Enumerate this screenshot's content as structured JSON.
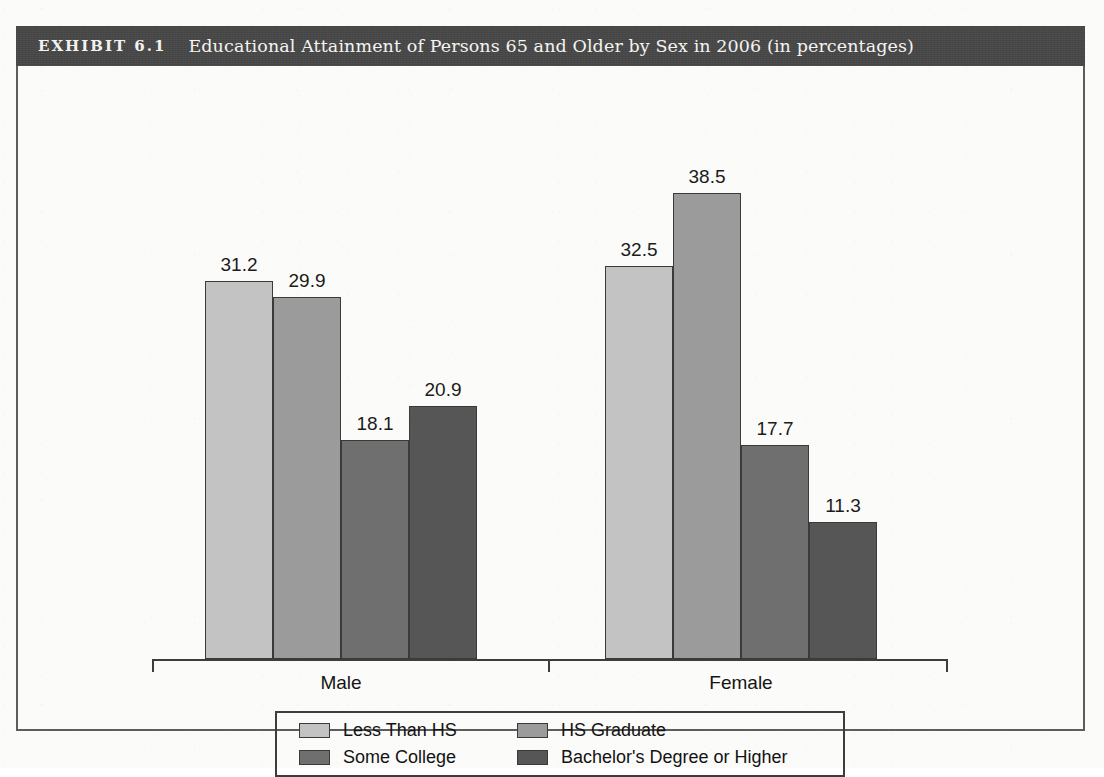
{
  "exhibit": {
    "label": "EXHIBIT 6.1",
    "title": "Educational Attainment of Persons 65 and Older by Sex in 2006 (in percentages)",
    "banner_color": "#474747",
    "banner_text_color": "#f2f2ee",
    "frame_color": "#5d5d5d",
    "page_background": "#fbfbf9"
  },
  "chart_data": {
    "type": "bar",
    "title": "Educational Attainment of Persons 65 and Older by Sex in 2006 (in percentages)",
    "xlabel": "",
    "ylabel": "",
    "ylim": [
      0,
      40
    ],
    "grid": false,
    "legend_position": "bottom",
    "value_labels": true,
    "units": "percent",
    "categories": [
      "Male",
      "Female"
    ],
    "series": [
      {
        "name": "Less Than HS",
        "color": "#c3c3c3",
        "values": [
          31.2,
          32.5
        ]
      },
      {
        "name": "HS Graduate",
        "color": "#9b9b9b",
        "values": [
          29.9,
          38.5
        ]
      },
      {
        "name": "Some College",
        "color": "#6f6f6f",
        "values": [
          18.1,
          17.7
        ]
      },
      {
        "name": "Bachelor's Degree or Higher",
        "color": "#565656",
        "values": [
          20.9,
          11.3
        ]
      }
    ],
    "bars": [
      {
        "group": "Male",
        "series": "Less Than HS",
        "value": 31.2,
        "label": "31.2"
      },
      {
        "group": "Male",
        "series": "HS Graduate",
        "value": 29.9,
        "label": "29.9"
      },
      {
        "group": "Male",
        "series": "Some College",
        "value": 18.1,
        "label": "18.1"
      },
      {
        "group": "Male",
        "series": "Bachelor's Degree or Higher",
        "value": 20.9,
        "label": "20.9"
      },
      {
        "group": "Female",
        "series": "Less Than HS",
        "value": 32.5,
        "label": "32.5"
      },
      {
        "group": "Female",
        "series": "HS Graduate",
        "value": 38.5,
        "label": "38.5"
      },
      {
        "group": "Female",
        "series": "Some College",
        "value": 17.7,
        "label": "17.7"
      },
      {
        "group": "Female",
        "series": "Bachelor's Degree or Higher",
        "value": 11.3,
        "label": "11.3"
      }
    ]
  },
  "axis": {
    "group_labels": [
      "Male",
      "Female"
    ],
    "line_color": "#3d3d3d"
  },
  "legend": {
    "border_color": "#3d3d3d",
    "items": [
      {
        "label": "Less Than HS",
        "color": "#c3c3c3"
      },
      {
        "label": "HS Graduate",
        "color": "#9b9b9b"
      },
      {
        "label": "Some College",
        "color": "#6f6f6f"
      },
      {
        "label": "Bachelor's Degree or Higher",
        "color": "#565656"
      }
    ]
  }
}
